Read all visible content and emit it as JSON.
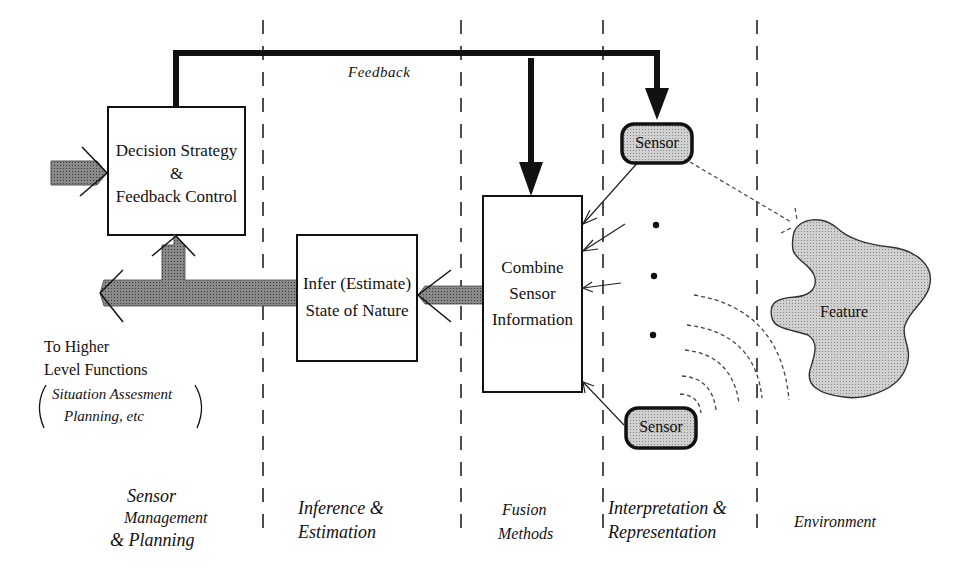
{
  "diagram": {
    "feedback_label": "Feedback",
    "decision_box": {
      "line1": "Decision Strategy",
      "line2": "&",
      "line3": "Feedback Control"
    },
    "infer_box": {
      "line1": "Infer (Estimate)",
      "line2": "State of Nature"
    },
    "combine_box": {
      "line1": "Combine",
      "line2": "Sensor",
      "line3": "Information"
    },
    "sensor_top": "Sensor",
    "sensor_bottom": "Sensor",
    "feature": "Feature",
    "higher_level": {
      "line1": "To Higher",
      "line2": "Level  Functions",
      "paren1": "Situation Assesment",
      "paren2": "Planning, etc"
    },
    "columns": [
      {
        "lines": [
          "Sensor",
          "Management",
          "& Planning"
        ]
      },
      {
        "lines": [
          "Inference &",
          "Estimation"
        ]
      },
      {
        "lines": [
          "Fusion",
          "Methods"
        ]
      },
      {
        "lines": [
          "Interpretation &",
          "Representation"
        ]
      },
      {
        "lines": [
          "Environment"
        ]
      }
    ],
    "colors": {
      "line": "#111111",
      "shade": "#9a9a9a",
      "sensor_fill": "#c8c8c8",
      "feature_fill": "#cfcfcf"
    }
  }
}
